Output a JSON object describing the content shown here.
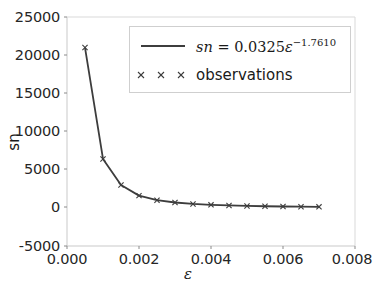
{
  "chart_data": {
    "type": "line",
    "title": "",
    "xlabel": "ε",
    "ylabel": "sn",
    "xlim": [
      0.0,
      0.008
    ],
    "ylim": [
      -5000,
      25000
    ],
    "grid": false,
    "legend_position": "upper right",
    "x_ticks": [
      "0.000",
      "0.002",
      "0.004",
      "0.006",
      "0.008"
    ],
    "x_tick_values": [
      0.0,
      0.002,
      0.004,
      0.006,
      0.008
    ],
    "y_ticks": [
      "-5000",
      "0",
      "5000",
      "10000",
      "15000",
      "20000",
      "25000"
    ],
    "y_tick_values": [
      -5000,
      0,
      5000,
      10000,
      15000,
      20000,
      25000
    ],
    "series": [
      {
        "name": "fit",
        "legend_label": "sn = 0.0325ε^-1.7610",
        "legend_label_parts": {
          "lhs": "sn",
          "equals": " = ",
          "coefficient": "0.0325",
          "base": "ε",
          "exponent": "−1.7610"
        },
        "style": "line",
        "color": "#3d3d3d",
        "x": [
          0.0005,
          0.001,
          0.0015,
          0.002,
          0.0025,
          0.003,
          0.0035,
          0.004,
          0.0045,
          0.005,
          0.0055,
          0.006,
          0.0065,
          0.007
        ],
        "y": [
          21000,
          6400,
          3000,
          1600,
          1000,
          700,
          510,
          390,
          310,
          250,
          210,
          175,
          150,
          130
        ]
      },
      {
        "name": "observations",
        "legend_label": "observations",
        "style": "marker",
        "marker": "x",
        "color": "#3d3d3d",
        "x": [
          0.0005,
          0.001,
          0.0015,
          0.002,
          0.0025,
          0.003,
          0.0035,
          0.004,
          0.0045,
          0.005,
          0.0055,
          0.006,
          0.0065,
          0.007
        ],
        "y": [
          21000,
          6400,
          3000,
          1600,
          1000,
          700,
          510,
          390,
          310,
          250,
          210,
          175,
          150,
          130
        ]
      }
    ]
  },
  "axes": {
    "ylabel_text": "sn",
    "xlabel_text": "ε"
  },
  "legend": {
    "fit_label_lhs": "sn",
    "fit_label_eq": " = 0.0325",
    "fit_label_base": "ε",
    "fit_label_exp": "−1.7610",
    "observations_label": "observations"
  },
  "colors": {
    "line": "#3d3d3d",
    "marker": "#3d3d3d",
    "axis": "#bfbfbf",
    "text": "#1a1a1a",
    "background": "#ffffff"
  }
}
